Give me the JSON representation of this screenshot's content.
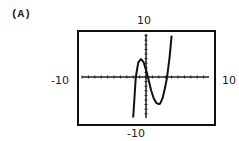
{
  "panel": {
    "label": "(A)"
  },
  "chart_data": {
    "type": "line",
    "title": "",
    "panel_label": "(A)",
    "xlabel": "",
    "ylabel": "",
    "xlim": [
      -10,
      10
    ],
    "ylim": [
      -10,
      10
    ],
    "window_labels": {
      "ymax": "10",
      "xmin": "-10",
      "ymin": "-10",
      "xmax": "10"
    },
    "grid": false,
    "axes_tick_marks": true,
    "legend": null,
    "series": [
      {
        "name": "f(x)",
        "x": [
          -2.0,
          -1.6,
          -1.2,
          -0.8,
          -0.4,
          0.0,
          0.3,
          0.8,
          1.2,
          1.6,
          2.0,
          2.2,
          2.6,
          3.0,
          3.3,
          3.7,
          4.0
        ],
        "y": [
          -8.8,
          0.0,
          3.2,
          3.9,
          3.3,
          1.6,
          0.0,
          -2.9,
          -4.6,
          -5.6,
          -5.9,
          -5.8,
          -4.6,
          -2.2,
          0.0,
          4.5,
          9.0
        ]
      }
    ],
    "zeros_approx": [
      -1.6,
      0.3,
      3.3
    ],
    "local_max_approx": {
      "x": -0.8,
      "y": 3.9
    },
    "local_min_approx": {
      "x": 2.2,
      "y": -5.9
    }
  },
  "layout": {
    "box": {
      "x": 78,
      "y": 31,
      "w": 137,
      "h": 94
    },
    "origin": {
      "x": 146,
      "y": 77
    },
    "x_axis": {
      "x1": 82,
      "x2": 209
    },
    "y_axis": {
      "y1": 34,
      "y2": 118
    },
    "px_per_unit_x": 6.4,
    "px_per_unit_y": 4.6
  }
}
